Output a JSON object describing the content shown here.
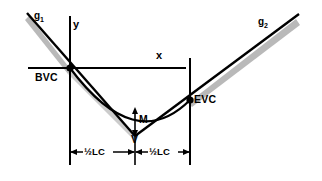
{
  "diagram": {
    "type": "engineering-line-diagram",
    "colors": {
      "line": "#000000",
      "shadow": "#b3b3b3",
      "background": "#ffffff"
    },
    "axes": {
      "x_label": "x",
      "y_label": "y",
      "x_axis": {
        "x1": 28,
        "y1": 68,
        "x2": 186,
        "y2": 68
      },
      "y_axis": {
        "x1": 70,
        "y1": 16,
        "x2": 70,
        "y2": 165
      }
    },
    "grades": {
      "incoming": {
        "label": "g",
        "subscript": "1"
      },
      "outgoing": {
        "label": "g",
        "subscript": "2"
      }
    },
    "points": {
      "bvc": {
        "label": "BVC",
        "x": 70,
        "y": 68
      },
      "evc": {
        "label": "EVC",
        "x": 190,
        "y": 100
      },
      "pvi": {
        "label": "V",
        "x": 135,
        "y": 134
      },
      "middle_ordinate": {
        "label": "M",
        "x": 135,
        "y": 114
      }
    },
    "dimensions": {
      "left": {
        "label": "½LC",
        "from_x": 70,
        "to_x": 135,
        "y": 152
      },
      "right": {
        "label": "½LC",
        "from_x": 135,
        "to_x": 190,
        "y": 152
      }
    }
  }
}
